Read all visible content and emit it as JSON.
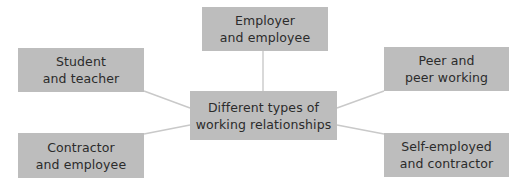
{
  "diagram": {
    "type": "mind-map",
    "center": {
      "lines": [
        "Different types of",
        "working relationships"
      ]
    },
    "branches": [
      {
        "id": "top",
        "lines": [
          "Employer",
          "and employee"
        ]
      },
      {
        "id": "top-left",
        "lines": [
          "Student",
          "and teacher"
        ]
      },
      {
        "id": "top-right",
        "lines": [
          "Peer and",
          "peer working"
        ]
      },
      {
        "id": "bottom-left",
        "lines": [
          "Contractor",
          "and employee"
        ]
      },
      {
        "id": "bottom-right",
        "lines": [
          "Self-employed",
          "and contractor"
        ]
      }
    ],
    "colors": {
      "node_fill": "#bdbdbd",
      "node_text": "#2b2b2b",
      "connector": "#c9c9c9",
      "background": "#ffffff"
    }
  }
}
